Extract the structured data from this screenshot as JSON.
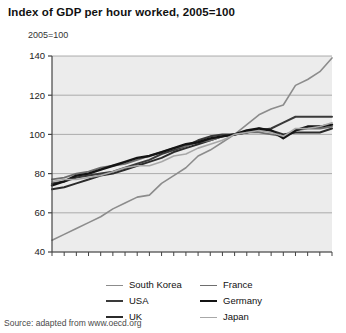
{
  "title": "Index of GDP per hour worked, 2005=100",
  "axis_note": "2005=100",
  "source": "Source: adapted from www.oecd.org",
  "legend": {
    "left": [
      {
        "label": "South Korea",
        "color": "#8c8c8c",
        "width": 1.6
      },
      {
        "label": "USA",
        "color": "#3a3a3a",
        "width": 2.0
      },
      {
        "label": "UK",
        "color": "#2b2b2b",
        "width": 2.0
      }
    ],
    "right": [
      {
        "label": "France",
        "color": "#6e6e6e",
        "width": 1.8
      },
      {
        "label": "Germany",
        "color": "#141414",
        "width": 2.4
      },
      {
        "label": "Japan",
        "color": "#a8a8a8",
        "width": 1.6
      }
    ]
  },
  "chart_data": {
    "type": "line",
    "title": "Index of GDP per hour worked, 2005=100",
    "subtitle": "2005=100",
    "xlabel": "",
    "ylabel": "2005=100",
    "xlim": [
      1990,
      2013
    ],
    "ylim": [
      40,
      140
    ],
    "yticks": [
      40,
      60,
      80,
      100,
      120,
      140
    ],
    "ytick_labels": [
      "40",
      "60",
      "80",
      "100",
      "120",
      "140"
    ],
    "xticks": [
      1990,
      1991,
      1992,
      1993,
      1994,
      1995,
      1996,
      1997,
      1998,
      1999,
      2000,
      2001,
      2002,
      2003,
      2004,
      2005,
      2006,
      2007,
      2008,
      2009,
      2010,
      2011,
      2012,
      2013
    ],
    "xtick_labels": [
      {
        "x": 1990,
        "label": "1990"
      },
      {
        "x": 1995,
        "label": "95"
      },
      {
        "x": 2000,
        "label": "00"
      },
      {
        "x": 2005,
        "label": "05"
      },
      {
        "x": 2010,
        "label": "10"
      },
      {
        "x": 2013,
        "label": "13"
      }
    ],
    "grid": "horizontal",
    "legend_position": "bottom",
    "x": [
      1990,
      1991,
      1992,
      1993,
      1994,
      1995,
      1996,
      1997,
      1998,
      1999,
      2000,
      2001,
      2002,
      2003,
      2004,
      2005,
      2006,
      2007,
      2008,
      2009,
      2010,
      2011,
      2012,
      2013
    ],
    "series": [
      {
        "name": "South Korea",
        "color": "#8c8c8c",
        "width": 1.6,
        "values": [
          46,
          49,
          52,
          55,
          58,
          62,
          65,
          68,
          69,
          75,
          79,
          83,
          89,
          92,
          96,
          100,
          105,
          110,
          113,
          115,
          125,
          128,
          132,
          139
        ]
      },
      {
        "name": "USA",
        "color": "#3a3a3a",
        "width": 2.0,
        "values": [
          75,
          76,
          78,
          79,
          80,
          81,
          83,
          85,
          87,
          90,
          92,
          94,
          97,
          99,
          100,
          100,
          101,
          102,
          103,
          106,
          109,
          109,
          109,
          109
        ]
      },
      {
        "name": "UK",
        "color": "#2b2b2b",
        "width": 2.0,
        "values": [
          72,
          73,
          75,
          77,
          79,
          80,
          82,
          84,
          86,
          88,
          91,
          93,
          95,
          97,
          99,
          100,
          101,
          103,
          102,
          100,
          101,
          101,
          101,
          103
        ]
      },
      {
        "name": "France",
        "color": "#6e6e6e",
        "width": 1.8,
        "values": [
          77,
          78,
          80,
          81,
          83,
          84,
          85,
          87,
          89,
          91,
          93,
          94,
          96,
          97,
          99,
          100,
          101,
          101,
          100,
          99,
          102,
          103,
          103,
          104
        ]
      },
      {
        "name": "Germany",
        "color": "#141414",
        "width": 2.4,
        "values": [
          74,
          76,
          79,
          80,
          82,
          84,
          86,
          88,
          89,
          91,
          93,
          95,
          96,
          98,
          99,
          100,
          102,
          103,
          102,
          98,
          102,
          104,
          104,
          105
        ]
      },
      {
        "name": "Japan",
        "color": "#a8a8a8",
        "width": 1.6,
        "values": [
          76,
          77,
          77,
          78,
          79,
          81,
          83,
          84,
          84,
          86,
          89,
          90,
          93,
          95,
          97,
          100,
          101,
          102,
          101,
          99,
          103,
          103,
          104,
          106
        ]
      }
    ]
  }
}
